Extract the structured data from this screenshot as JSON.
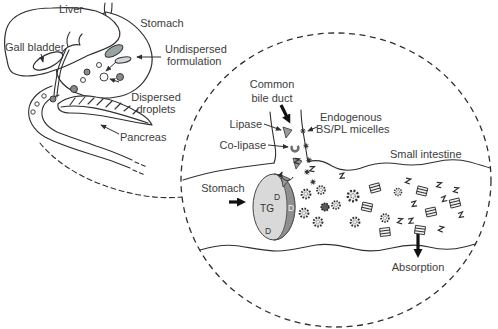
{
  "colors": {
    "line": "#2f2f2f",
    "label_text": "#3d3d3d",
    "formulation_gray": "#9aa3a3",
    "droplet_gray": "#8a8a8a",
    "tg_core_light": "#d9d9d9",
    "interface_crescent": "#8f8f8f",
    "background": "#ffffff"
  },
  "anatomy": {
    "liver": "Liver",
    "stomach": "Stomach",
    "gall_bladder": "Gall bladder",
    "undispersed_line1": "Undispersed",
    "undispersed_line2": "formulation",
    "dispersed_line1": "Dispersed",
    "dispersed_line2": "droplets",
    "pancreas": "Pancreas"
  },
  "magnified": {
    "common_bile_duct_line1": "Common",
    "common_bile_duct_line2": "bile duct",
    "lipase": "Lipase",
    "co_lipase": "Co-lipase",
    "endogenous_line1": "Endogenous",
    "endogenous_line2": "BS/PL micelles",
    "small_intestine": "Small intestine",
    "stomach": "Stomach",
    "triglyceride": "TG",
    "digestion_product_top": "D",
    "digestion_product_mid": "D",
    "digestion_product_bottom": "D",
    "absorption": "Absorption"
  }
}
